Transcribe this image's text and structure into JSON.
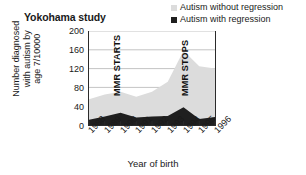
{
  "chart_data": {
    "type": "area",
    "title": "Yokohama study",
    "xlabel": "Year of birth",
    "ylabel": "Number diagnosed with autism by age 7/10000",
    "ylabel_line1": "Number diagnosed",
    "ylabel_line2": "with autism by",
    "ylabel_line3": "age 7/10000",
    "categories": [
      "1988",
      "1989",
      "1990",
      "1991",
      "1992",
      "1993",
      "1994",
      "1995",
      "1996"
    ],
    "ylim": [
      0,
      200
    ],
    "yticks": [
      200,
      160,
      120,
      80,
      40,
      0
    ],
    "grid": true,
    "stacked": true,
    "legend_position": "top-right",
    "series": [
      {
        "name": "Autism with regression",
        "color": "#1f1f1f",
        "values": [
          11,
          18,
          26,
          16,
          18,
          19,
          38,
          13,
          17
        ]
      },
      {
        "name": "Autism without regression",
        "color": "#dcdcdc",
        "values": [
          44,
          47,
          45,
          44,
          53,
          73,
          120,
          112,
          103
        ]
      }
    ],
    "totals": [
      55,
      65,
      71,
      60,
      71,
      92,
      158,
      125,
      120
    ],
    "annotations": [
      {
        "text": "MMR STARTS",
        "at_x": "1990",
        "orientation": "vertical"
      },
      {
        "text": "MMR STOPS",
        "at_x": "1993",
        "orientation": "vertical"
      }
    ]
  },
  "legend": {
    "items": [
      {
        "label": "Autism without regression",
        "marker": "light-square"
      },
      {
        "label": "Autism with regression",
        "marker": "dark-square"
      }
    ]
  }
}
